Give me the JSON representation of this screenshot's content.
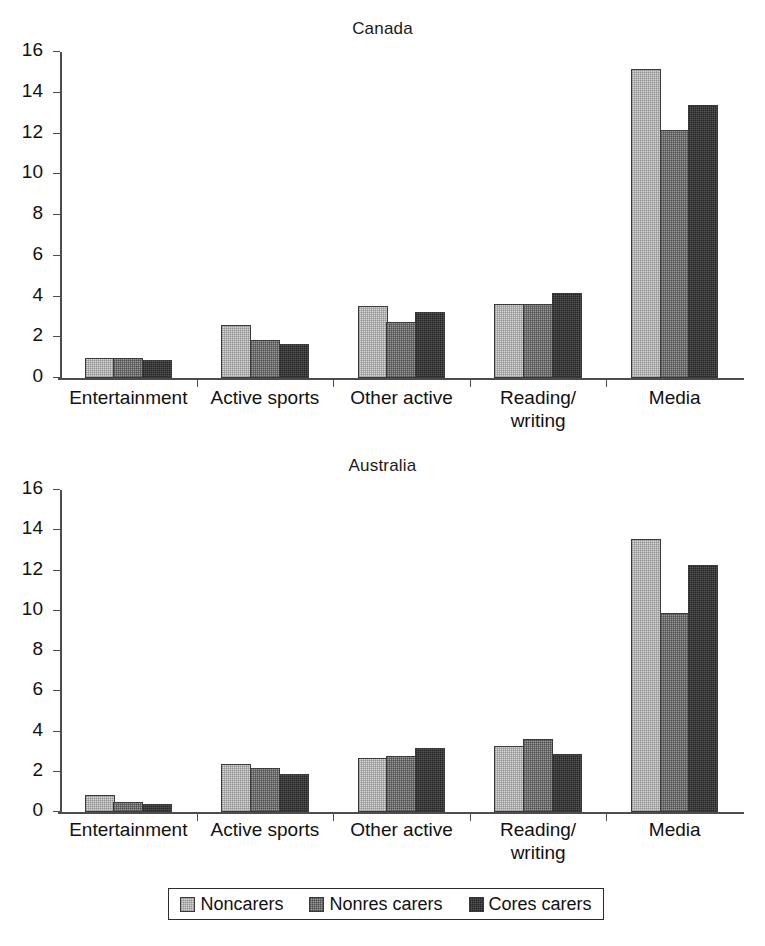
{
  "figure": {
    "width": 765,
    "height": 946,
    "background": "#ffffff"
  },
  "legend": {
    "position": "bottom-center",
    "entries": [
      {
        "label": "Noncarers",
        "color": "#d6d6d6",
        "swatch_name": "legend-swatch-noncarers"
      },
      {
        "label": "Nonres carers",
        "color": "#9a9a9a",
        "swatch_name": "legend-swatch-nonres-carers"
      },
      {
        "label": "Cores carers",
        "color": "#565656",
        "swatch_name": "legend-swatch-cores-carers"
      }
    ]
  },
  "chart_data": [
    {
      "type": "bar",
      "title": "Canada",
      "xlabel": "",
      "ylabel": "",
      "ylim": [
        0,
        16
      ],
      "yticks": [
        0,
        2,
        4,
        6,
        8,
        10,
        12,
        14,
        16
      ],
      "grid": false,
      "legend_position": "bottom",
      "categories": [
        "Entertainment",
        "Active sports",
        "Other active",
        "Reading/\nwriting",
        "Media"
      ],
      "series": [
        {
          "name": "Noncarers",
          "color": "#d6d6d6",
          "values": [
            1.0,
            2.6,
            3.55,
            3.65,
            15.15
          ]
        },
        {
          "name": "Nonres carers",
          "color": "#9a9a9a",
          "values": [
            1.0,
            1.85,
            2.75,
            3.65,
            12.15
          ]
        },
        {
          "name": "Cores carers",
          "color": "#565656",
          "values": [
            0.9,
            1.65,
            3.25,
            4.15,
            13.4
          ]
        }
      ]
    },
    {
      "type": "bar",
      "title": "Australia",
      "xlabel": "",
      "ylabel": "",
      "ylim": [
        0,
        16
      ],
      "yticks": [
        0,
        2,
        4,
        6,
        8,
        10,
        12,
        14,
        16
      ],
      "grid": false,
      "legend_position": "bottom",
      "categories": [
        "Entertainment",
        "Active sports",
        "Other active",
        "Reading/\nwriting",
        "Media"
      ],
      "series": [
        {
          "name": "Noncarers",
          "color": "#d6d6d6",
          "values": [
            0.85,
            2.4,
            2.7,
            3.3,
            13.55
          ]
        },
        {
          "name": "Nonres carers",
          "color": "#9a9a9a",
          "values": [
            0.5,
            2.2,
            2.8,
            3.65,
            9.9
          ]
        },
        {
          "name": "Cores carers",
          "color": "#565656",
          "values": [
            0.4,
            1.9,
            3.2,
            2.9,
            12.25
          ]
        }
      ]
    }
  ]
}
